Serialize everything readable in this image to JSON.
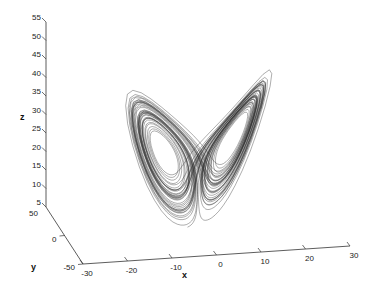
{
  "chart_data": {
    "type": "line",
    "subtype": "3d-line",
    "title": "",
    "xlabel": "x",
    "ylabel": "y",
    "zlabel": "z",
    "xlim": [
      -30,
      30
    ],
    "ylim": [
      -50,
      50
    ],
    "zlim": [
      5,
      55
    ],
    "x_ticks": [
      -30,
      -20,
      -10,
      0,
      10,
      20,
      30
    ],
    "y_ticks": [
      -50,
      0,
      50
    ],
    "z_ticks": [
      5,
      10,
      15,
      20,
      25,
      30,
      35,
      40,
      45,
      50,
      55
    ],
    "grid": false,
    "legend": null,
    "line_color": "#333333",
    "series": [
      {
        "name": "lorenz-trajectory",
        "system": "lorenz",
        "parameters": {
          "sigma": 10,
          "rho": 28,
          "beta": 2.6667
        },
        "approx_range": {
          "x": [
            -20,
            20
          ],
          "y": [
            -27,
            28
          ],
          "z": [
            5,
            48
          ]
        },
        "lobe_centers": [
          [
            -8.5,
            -8.5,
            27
          ],
          [
            8.5,
            8.5,
            27
          ]
        ]
      }
    ]
  }
}
